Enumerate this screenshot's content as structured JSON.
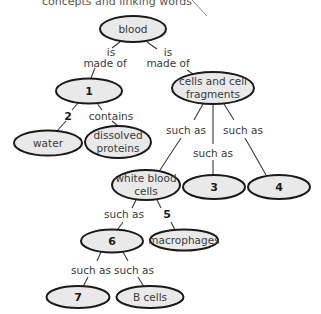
{
  "header": {
    "partial_text": "concepts and linking words"
  },
  "nodes": {
    "blood": {
      "label": "blood"
    },
    "n1": {
      "label": "1"
    },
    "cells": {
      "line1": "cells and cell",
      "line2": "fragments"
    },
    "water": {
      "label": "water"
    },
    "proteins": {
      "line1": "dissolved",
      "line2": "proteins"
    },
    "wbc": {
      "line1": "white blood",
      "line2": "cells"
    },
    "n3": {
      "label": "3"
    },
    "n4": {
      "label": "4"
    },
    "n6": {
      "label": "6"
    },
    "macrophages": {
      "label": "macrophages"
    },
    "n7": {
      "label": "7"
    },
    "bcells": {
      "label": "B cells"
    }
  },
  "links": {
    "blood_n1": {
      "line1": "is",
      "line2": "made of"
    },
    "blood_cells": {
      "line1": "is",
      "line2": "made of"
    },
    "n1_water": {
      "label": "2"
    },
    "n1_proteins": {
      "label": "contains"
    },
    "cells_wbc": {
      "label": "such as"
    },
    "cells_n3": {
      "label": "such as"
    },
    "cells_n4": {
      "label": "such as"
    },
    "wbc_n6": {
      "label": "such as"
    },
    "wbc_macrophages": {
      "label": "5"
    },
    "n6_n7": {
      "label": "such as"
    },
    "n6_bcells": {
      "label": "such as"
    }
  },
  "colors": {
    "node_fill": "#e9e9e9",
    "node_stroke": "#1a1a1a",
    "text": "#3a3a3a"
  }
}
